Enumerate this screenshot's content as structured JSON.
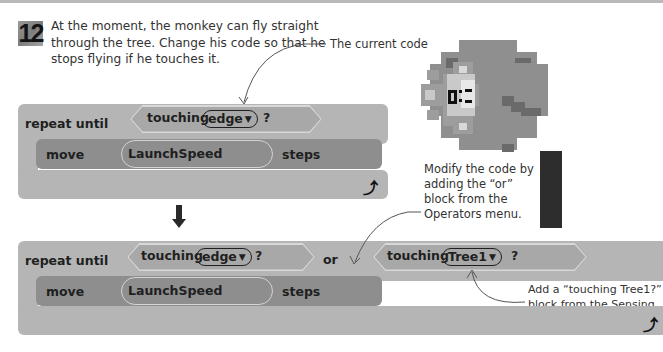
{
  "step": {
    "number": "12",
    "instruction": "At the moment, the monkey can fly straight through the tree. Change his code so that he stops flying if he touches it."
  },
  "annotations": {
    "current_code": "The current code",
    "modify_code": "Modify the code by adding the “or” block from the Operators menu.",
    "add_touching": "Add a “touching Tree1?” block from the Sensing section."
  },
  "current_script": {
    "loop_label": "repeat until",
    "condition": {
      "label": "touching",
      "option": "edge",
      "suffix": "?"
    },
    "move": {
      "label": "move",
      "value": "LaunchSpeed",
      "unit": "steps"
    },
    "loop_icon": "loop-arrow-icon"
  },
  "modified_script": {
    "loop_label": "repeat until",
    "condition_a": {
      "label": "touching",
      "option": "edge",
      "suffix": "?"
    },
    "operator": "or",
    "condition_b": {
      "label": "touching",
      "option": "Tree1",
      "suffix": "?"
    },
    "move": {
      "label": "move",
      "value": "LaunchSpeed",
      "unit": "steps"
    },
    "loop_icon": "loop-arrow-icon"
  },
  "glyphs": {
    "dropdown": "▼",
    "loop": "⤴"
  },
  "colors": {
    "loop_block": "#b5b5b5",
    "motion_block": "#8e8e8e",
    "tree_foliage": "#8f8f8f",
    "tree_trunk": "#2d2d2d"
  }
}
